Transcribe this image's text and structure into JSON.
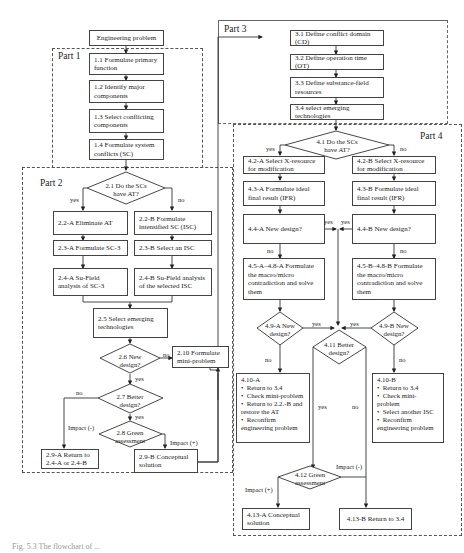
{
  "header_fragment": "",
  "caption": "Fig. 5.3  The flowchart of ...",
  "start": "Engineering problem",
  "parts": {
    "part1": {
      "label": "Part 1",
      "steps": [
        "1.1 Formulate primary function",
        "1.2 Identify major components",
        "1.3 Select conflicting components",
        "1.4 Formulate system conflicts (SC)"
      ]
    },
    "part2": {
      "label": "Part 2",
      "d21": "2.1 Do the SCs have AT?",
      "yes": "yes",
      "no": "no",
      "a22": "2.2-A Eliminate AT",
      "b22": "2.2-B Formulate intensified SC (ISC)",
      "a23": "2.3-A Formulate SC-3",
      "b23": "2.3-B Select an ISC",
      "a24": "2.4-A Su-Field analysis of SC-3",
      "b24": "2.4-B Su-Field analysis of the selected ISC",
      "s25": "2.5 Select emerging technologies",
      "d26": "2.6 New design?",
      "d26_no": "no",
      "d26_yes": "yes",
      "s210": "2.10 Formulate mini-problem",
      "d27": "2.7 Better design?",
      "d27_no": "no",
      "d27_yes": "yes",
      "d28": "2.8 Green assessment",
      "impact_neg": "Impact (-)",
      "impact_pos": "Impact (+)",
      "a29": "2.9-A Return to 2.4-A or 2.4-B",
      "b29": "2.9-B Conceptual solution"
    },
    "part3": {
      "label": "Part 3",
      "steps": [
        "3.1 Define conflict domain (CD)",
        "3.2 Define operation time (OT)",
        "3.3 Define substance-field resources",
        "3.4 select emerging technologies"
      ]
    },
    "part4": {
      "label": "Part 4",
      "d41": "4.1 Do the SCs have AT?",
      "yes": "yes",
      "no": "no",
      "a42": "4.2-A Select X-resource for modification",
      "b42": "4.2-B Select X-resource for modification",
      "a43": "4.3-A Formulate ideal final result (IFR)",
      "b43": "4.3-B Formulate ideal final result (IFR)",
      "a44": "4.4-A New design?",
      "b44": "4.4-B New design?",
      "a44_yes": "yes",
      "b44_yes": "yes",
      "a44_no": "no",
      "b44_no": "no",
      "a45": "4.5-A–4.8-A Formulate the macro/micro contradiction and solve them",
      "b45": "4.5-B–4.8-B Formulate the macro/micro contradiction and solve them",
      "a49": "4.9-A New design?",
      "b49": "4.9-B New design?",
      "a49_yes": "yes",
      "b49_yes": "yes",
      "a49_no": "no",
      "b49_no": "no",
      "d411": "4.11 Better design?",
      "d411_yes": "yes",
      "d411_no": "no",
      "a410": {
        "title": "4.10-A",
        "items": [
          "Return to 3.4",
          "Check mini-problem",
          "Return to 2.2.-B and restore the AT",
          "Reconfirm engineering problem"
        ]
      },
      "b410": {
        "title": "4.10-B",
        "items": [
          "Return to 3.4",
          "Check mini-problem",
          "Select another ISC",
          "Reconfirm engineering problem"
        ]
      },
      "d412": "4.12 Green assessment",
      "impact_neg": "Impact (-)",
      "impact_pos": "Impact (+)",
      "a413": "4.13-A Conceptual solution",
      "b413": "4.13-B Return to 3.4"
    }
  }
}
